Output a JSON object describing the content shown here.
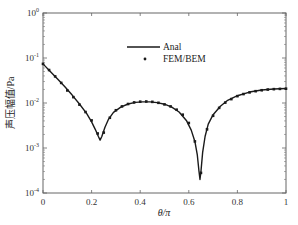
{
  "chart_data": {
    "type": "line",
    "title": "",
    "xlabel": "θ/π",
    "ylabel": "声压幅值/Pa",
    "xlim": [
      0,
      1
    ],
    "ylim": [
      0.0001,
      1
    ],
    "yscale": "log",
    "grid": false,
    "legend_position": "upper center",
    "x_ticks": [
      "0",
      "0.2",
      "0.4",
      "0.6",
      "0.8",
      "1"
    ],
    "y_ticks": [
      "10^0",
      "10^-1",
      "10^-2",
      "10^-3",
      "10^-4"
    ],
    "series": [
      {
        "name": "Anal",
        "style": "solid-line",
        "x": [
          0.0,
          0.03,
          0.06,
          0.09,
          0.12,
          0.15,
          0.18,
          0.2,
          0.215,
          0.228,
          0.235,
          0.242,
          0.255,
          0.27,
          0.29,
          0.32,
          0.35,
          0.38,
          0.41,
          0.44,
          0.47,
          0.5,
          0.53,
          0.56,
          0.59,
          0.61,
          0.625,
          0.635,
          0.642,
          0.646,
          0.65,
          0.657,
          0.667,
          0.68,
          0.7,
          0.73,
          0.76,
          0.8,
          0.85,
          0.9,
          0.95,
          1.0
        ],
        "y": [
          0.074,
          0.05,
          0.034,
          0.023,
          0.015,
          0.0095,
          0.0058,
          0.0038,
          0.0026,
          0.0018,
          0.0015,
          0.0018,
          0.0029,
          0.0044,
          0.0062,
          0.0081,
          0.0095,
          0.0103,
          0.0106,
          0.0106,
          0.0102,
          0.0094,
          0.0081,
          0.0063,
          0.0041,
          0.0025,
          0.0014,
          0.0007,
          0.0003,
          0.0002,
          0.0003,
          0.0008,
          0.0018,
          0.0034,
          0.0055,
          0.0085,
          0.0115,
          0.0145,
          0.0175,
          0.0195,
          0.0205,
          0.021
        ]
      },
      {
        "name": "FEM/BEM",
        "style": "dot-markers",
        "x": [
          0.0,
          0.025,
          0.05,
          0.075,
          0.1,
          0.125,
          0.15,
          0.175,
          0.2,
          0.225,
          0.25,
          0.275,
          0.3,
          0.325,
          0.35,
          0.375,
          0.4,
          0.425,
          0.45,
          0.475,
          0.5,
          0.525,
          0.55,
          0.575,
          0.6,
          0.625,
          0.65,
          0.675,
          0.7,
          0.725,
          0.75,
          0.775,
          0.8,
          0.825,
          0.85,
          0.875,
          0.9,
          0.925,
          0.95,
          0.975,
          1.0
        ],
        "y": [
          0.074,
          0.054,
          0.039,
          0.028,
          0.019,
          0.0135,
          0.0092,
          0.0063,
          0.0041,
          0.0021,
          0.0022,
          0.0047,
          0.0069,
          0.0084,
          0.0095,
          0.0103,
          0.0107,
          0.0108,
          0.0106,
          0.0101,
          0.0093,
          0.0084,
          0.0071,
          0.0055,
          0.0036,
          0.0014,
          0.00028,
          0.0026,
          0.0052,
          0.0078,
          0.0102,
          0.0122,
          0.0142,
          0.0158,
          0.0172,
          0.0183,
          0.0192,
          0.0199,
          0.0203,
          0.0206,
          0.0208
        ]
      }
    ]
  },
  "axes": {
    "xlabel": "θ/π",
    "ylabel": "声压幅值/Pa",
    "x_ticks": [
      {
        "v": 0,
        "label": "0"
      },
      {
        "v": 0.2,
        "label": "0.2"
      },
      {
        "v": 0.4,
        "label": "0.4"
      },
      {
        "v": 0.6,
        "label": "0.6"
      },
      {
        "v": 0.8,
        "label": "0.8"
      },
      {
        "v": 1,
        "label": "1"
      }
    ],
    "y_ticks": [
      {
        "exp": 0,
        "base": "10",
        "sup": "0"
      },
      {
        "exp": -1,
        "base": "10",
        "sup": "-1"
      },
      {
        "exp": -2,
        "base": "10",
        "sup": "-2"
      },
      {
        "exp": -3,
        "base": "10",
        "sup": "-3"
      },
      {
        "exp": -4,
        "base": "10",
        "sup": "-4"
      }
    ]
  },
  "legend": {
    "items": [
      {
        "label": "Anal",
        "symbol": "line"
      },
      {
        "label": "FEM/BEM",
        "symbol": "dot"
      }
    ]
  },
  "colors": {
    "line": "#1a1a1a",
    "marker": "#1a1a1a",
    "axis": "#555555",
    "text": "#333333"
  }
}
